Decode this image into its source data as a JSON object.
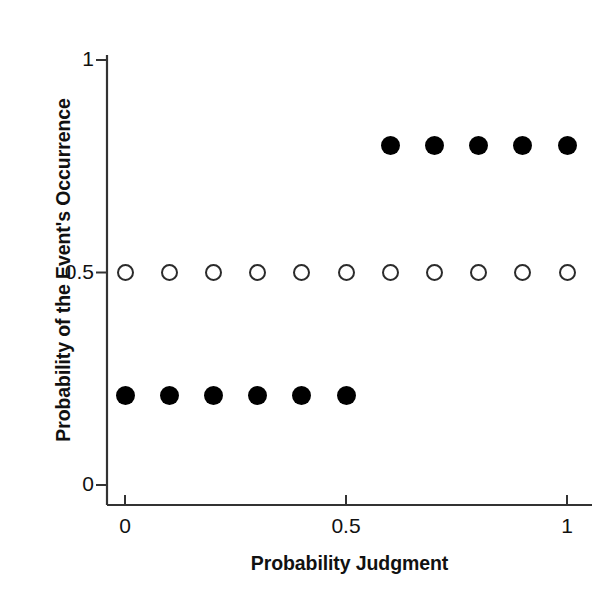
{
  "chart_data": {
    "type": "scatter",
    "title": "",
    "xlabel": "Probability Judgment",
    "ylabel": "Probability of the Event's Occurrence",
    "xlim": [
      0,
      1.09
    ],
    "ylim": [
      0,
      1.0
    ],
    "grid": false,
    "legend": "none",
    "xticks": [
      {
        "value": 0,
        "label": "0"
      },
      {
        "value": 0.5,
        "label": "0.5"
      },
      {
        "value": 1,
        "label": "1"
      }
    ],
    "yticks": [
      {
        "value": 0,
        "label": "0"
      },
      {
        "value": 0.5,
        "label": "0.5"
      },
      {
        "value": 1,
        "label": "1"
      }
    ],
    "series": [
      {
        "name": "open-circles",
        "marker": "open-circle",
        "marker_color": "#2b2b2b",
        "marker_size": 17,
        "x": [
          0.0,
          0.1,
          0.2,
          0.3,
          0.4,
          0.5,
          0.6,
          0.7,
          0.8,
          0.9,
          1.0
        ],
        "y": [
          0.5,
          0.5,
          0.5,
          0.5,
          0.5,
          0.5,
          0.5,
          0.5,
          0.5,
          0.5,
          0.5
        ]
      },
      {
        "name": "filled-circles-low",
        "marker": "filled-circle",
        "marker_color": "#000000",
        "marker_size": 19,
        "x": [
          0.0,
          0.1,
          0.2,
          0.3,
          0.4,
          0.5
        ],
        "y": [
          0.21,
          0.21,
          0.21,
          0.21,
          0.21,
          0.21
        ]
      },
      {
        "name": "filled-circles-high",
        "marker": "filled-circle",
        "marker_color": "#000000",
        "marker_size": 19,
        "x": [
          0.6,
          0.7,
          0.8,
          0.9,
          1.0
        ],
        "y": [
          0.8,
          0.8,
          0.8,
          0.8,
          0.8
        ]
      }
    ]
  },
  "axes": {
    "line_color": "#333333",
    "background": "#ffffff"
  }
}
